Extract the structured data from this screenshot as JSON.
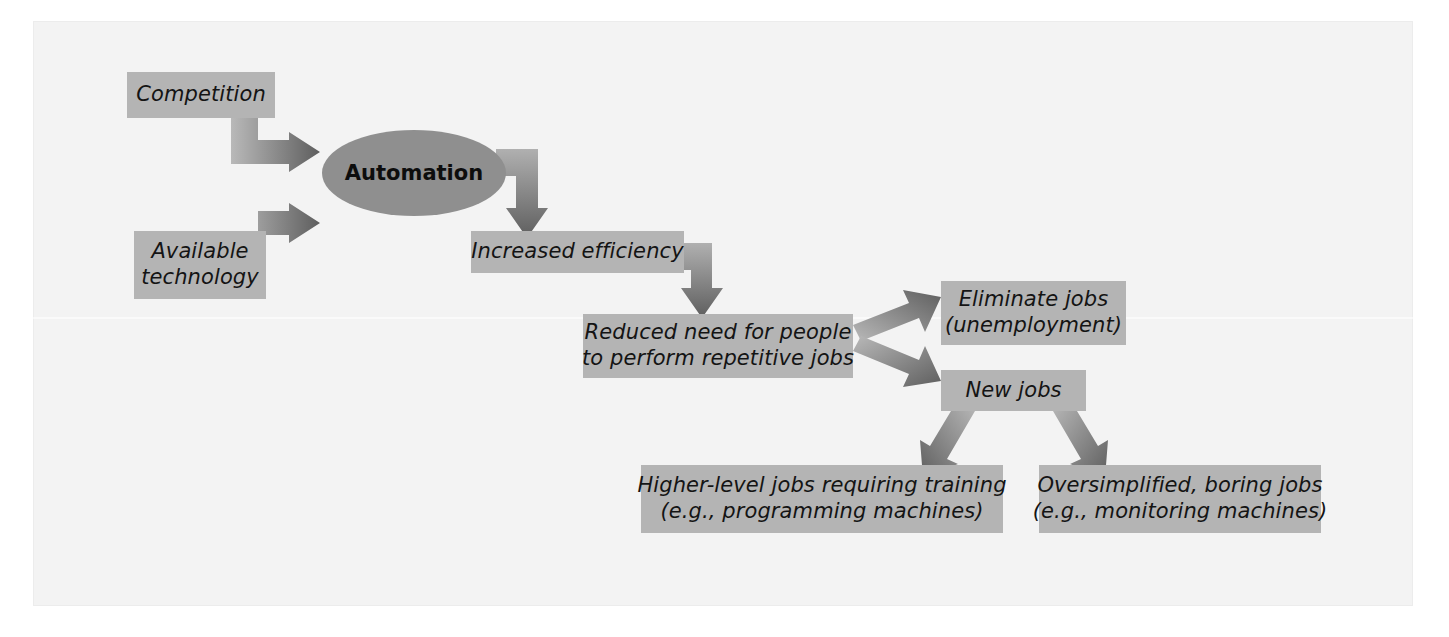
{
  "diagram": {
    "colors": {
      "page_background": "#f3f3f3",
      "box_fill": "#b4b4b4",
      "ellipse_fill": "#8f8f8f",
      "arrow_fill": "#707070",
      "text": "#141414"
    },
    "nodes": [
      {
        "id": "competition",
        "shape": "rectangle",
        "lines": [
          "Competition"
        ],
        "x": 127,
        "y": 72,
        "w": 148,
        "h": 46
      },
      {
        "id": "available-technology",
        "shape": "rectangle",
        "lines": [
          "Available",
          "technology"
        ],
        "x": 134,
        "y": 231,
        "w": 132,
        "h": 68
      },
      {
        "id": "automation",
        "shape": "ellipse",
        "lines": [
          "Automation"
        ],
        "x": 322,
        "y": 130,
        "w": 184,
        "h": 86
      },
      {
        "id": "increased-efficiency",
        "shape": "rectangle",
        "lines": [
          "Increased efficiency"
        ],
        "x": 471,
        "y": 231,
        "w": 213,
        "h": 42
      },
      {
        "id": "reduced-need",
        "shape": "rectangle",
        "lines": [
          "Reduced need for people",
          "to perform repetitive jobs"
        ],
        "x": 583,
        "y": 314,
        "w": 270,
        "h": 64
      },
      {
        "id": "eliminate-jobs",
        "shape": "rectangle",
        "lines": [
          "Eliminate jobs",
          "(unemployment)"
        ],
        "x": 941,
        "y": 281,
        "w": 185,
        "h": 64
      },
      {
        "id": "new-jobs",
        "shape": "rectangle",
        "lines": [
          "New jobs"
        ],
        "x": 941,
        "y": 370,
        "w": 145,
        "h": 41
      },
      {
        "id": "higher-level-jobs",
        "shape": "rectangle",
        "lines": [
          "Higher-level jobs requiring training",
          "(e.g., programming machines)"
        ],
        "x": 641,
        "y": 465,
        "w": 362,
        "h": 68
      },
      {
        "id": "oversimplified-jobs",
        "shape": "rectangle",
        "lines": [
          "Oversimplified, boring jobs",
          "(e.g., monitoring machines)"
        ],
        "x": 1039,
        "y": 465,
        "w": 282,
        "h": 68
      }
    ],
    "edges": [
      {
        "id": "competition-to-automation",
        "from": "competition",
        "to": "automation",
        "style": "elbow-down-right"
      },
      {
        "id": "available-technology-to-automation",
        "from": "available-technology",
        "to": "automation",
        "style": "elbow-up-right"
      },
      {
        "id": "automation-to-increased-efficiency",
        "from": "automation",
        "to": "increased-efficiency",
        "style": "elbow-right-down"
      },
      {
        "id": "increased-efficiency-to-reduced-need",
        "from": "increased-efficiency",
        "to": "reduced-need",
        "style": "elbow-right-down"
      },
      {
        "id": "reduced-need-to-eliminate-jobs",
        "from": "reduced-need",
        "to": "eliminate-jobs",
        "style": "diagonal-up-right"
      },
      {
        "id": "reduced-need-to-new-jobs",
        "from": "reduced-need",
        "to": "new-jobs",
        "style": "diagonal-down-right"
      },
      {
        "id": "new-jobs-to-higher-level-jobs",
        "from": "new-jobs",
        "to": "higher-level-jobs",
        "style": "diagonal-down-left"
      },
      {
        "id": "new-jobs-to-oversimplified-jobs",
        "from": "new-jobs",
        "to": "oversimplified-jobs",
        "style": "diagonal-down-right"
      }
    ]
  }
}
